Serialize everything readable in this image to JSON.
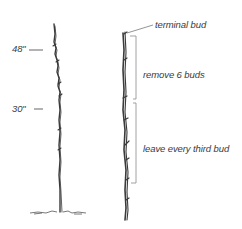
{
  "diagram": {
    "type": "pruning-illustration",
    "left_stem": {
      "height_marks": [
        {
          "label": "48\"",
          "y": 48
        },
        {
          "label": "30\"",
          "y": 108
        }
      ]
    },
    "right_stem": {
      "annotations": {
        "terminal_bud": "terminal bud",
        "upper_section": "remove 6 buds",
        "lower_section": "leave every third bud"
      }
    },
    "colors": {
      "stroke": "#3a3a3a",
      "bracket": "#8a8a8a",
      "background": "#ffffff"
    }
  }
}
